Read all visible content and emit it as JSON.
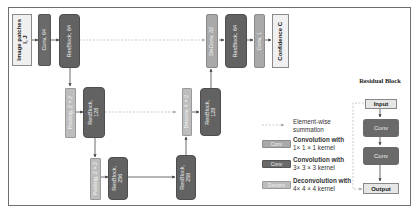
{
  "diagram": {
    "input_block": {
      "label": "Image patches\nI, J"
    },
    "blocks": {
      "conv_64_in": "Conv, 64",
      "resblock_64_a": "ResBlock, 64",
      "pooling_2x_a": "Pooling, 2×2",
      "resblock_128_a": "ResBlock,\n128",
      "pooling_2x_b": "Pooling, 2×2",
      "resblock_256": "ResBlock,\n256",
      "deconv_128": "Deconv, 4×2",
      "resblock_128_b": "ResBlock,\n128",
      "deconv_64": "DeConv, 32",
      "resblock_64_b": "ResBlock, 64",
      "conv_1": "Conv, 1"
    },
    "output_block": {
      "label": "Confidence C"
    }
  },
  "legend": {
    "items": [
      {
        "icon": "dashed-arrow-icon",
        "text_line1": "Element-wise",
        "text_line2": "summation"
      },
      {
        "icon_label": "Conv",
        "text_line1": "Convolution with",
        "text_line2": "1× 1 × 1 kernel",
        "color": "#a9a9a9"
      },
      {
        "icon_label": "Conv",
        "text_line1": "Convolution with",
        "text_line2": "3× 3 × 3 kernel",
        "color": "#6a6a6a"
      },
      {
        "icon_label": "Deconv",
        "text_line1": "Deconvolution with",
        "text_line2": "4× 4 × 4 kernel",
        "color": "#bdbdbd"
      }
    ]
  },
  "residual_block": {
    "title": "Residual Block",
    "input": "Input",
    "conv1": "Conv",
    "conv2": "Conv",
    "output": "Output"
  },
  "colors": {
    "conv1x1": "#a9a9a9",
    "conv3x3": "#6a6a6a",
    "resblock": "#626262",
    "deconv": "#bdbdbd",
    "border": "#6f6f6f"
  }
}
